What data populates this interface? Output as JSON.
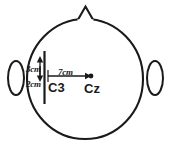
{
  "figure": {
    "stroke_color": "#1a1a1a",
    "fill_color": "#ffffff",
    "background_color": "#ffffff"
  },
  "head": {
    "outline_name": "head circle (scalp, top view)",
    "nose_name": "nose marker triangle",
    "left_ear_name": "left ear",
    "right_ear_name": "right ear"
  },
  "measurements": [
    {
      "id": "vertical_up",
      "label": "3cm",
      "orientation": "vertical",
      "direction": "up"
    },
    {
      "id": "vertical_down",
      "label": "2cm",
      "orientation": "vertical",
      "direction": "down"
    },
    {
      "id": "horizontal",
      "label": "7cm",
      "orientation": "horizontal",
      "direction": "right"
    }
  ],
  "electrodes": [
    {
      "id": "c3",
      "label": "C3"
    },
    {
      "id": "cz",
      "label": "Cz"
    }
  ]
}
